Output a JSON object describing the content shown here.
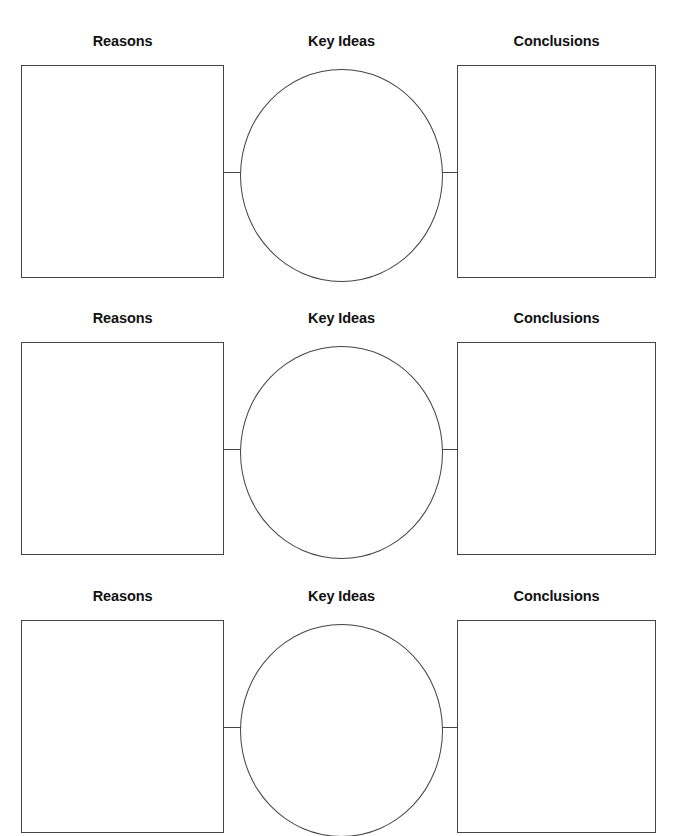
{
  "page": {
    "background_color": "#ffffff",
    "stroke_color": "#444444",
    "text_color": "#111111",
    "width": 677,
    "height": 836,
    "cropped_top_text": ""
  },
  "labels": {
    "reasons": "Reasons",
    "key_ideas": "Key Ideas",
    "conclusions": "Conclusions"
  },
  "rows": [
    {
      "index": 1,
      "label_top": 33,
      "shape_top": 65,
      "shape_height": 213,
      "reasons": "",
      "key_ideas": "",
      "conclusions": ""
    },
    {
      "index": 2,
      "label_top": 310,
      "shape_top": 342,
      "shape_height": 213,
      "reasons": "",
      "key_ideas": "",
      "conclusions": ""
    },
    {
      "index": 3,
      "label_top": 588,
      "shape_top": 620,
      "shape_height": 213,
      "reasons": "",
      "key_ideas": "",
      "conclusions": ""
    }
  ]
}
